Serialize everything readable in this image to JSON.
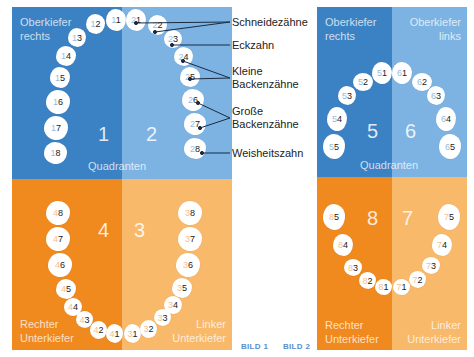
{
  "bild1": {
    "label": "BILD 1",
    "quadrants": {
      "q1": {
        "number": "1",
        "label_line1": "Oberkiefer",
        "label_line2": "rechts"
      },
      "q2": {
        "number": "2"
      },
      "q3": {
        "number": "3",
        "label_line1": "Linker",
        "label_line2": "Unterkiefer"
      },
      "q4": {
        "number": "4",
        "label_line1": "Rechter",
        "label_line2": "Unterkiefer"
      }
    },
    "center_label": "Quadranten",
    "teeth_q1": [
      "11",
      "12",
      "13",
      "14",
      "15",
      "16",
      "17",
      "18"
    ],
    "teeth_q2": [
      "21",
      "22",
      "23",
      "24",
      "25",
      "26",
      "27",
      "28"
    ],
    "teeth_q3": [
      "31",
      "32",
      "33",
      "34",
      "35",
      "36",
      "37",
      "38"
    ],
    "teeth_q4": [
      "41",
      "42",
      "43",
      "44",
      "45",
      "46",
      "47",
      "48"
    ],
    "annotations": {
      "schneidezaehne": "Schneidezähne",
      "eckzahn": "Eckzahn",
      "kleine_1": "Kleine",
      "kleine_2": "Backenzähne",
      "grosse_1": "Große",
      "grosse_2": "Backenzähne",
      "weisheitszahn": "Weisheitszahn"
    }
  },
  "bild2": {
    "label": "BILD 2",
    "quadrants": {
      "q5": {
        "number": "5",
        "label_line1": "Oberkiefer",
        "label_line2": "rechts"
      },
      "q6": {
        "number": "6",
        "label_line1": "Oberkiefer",
        "label_line2": "links"
      },
      "q7": {
        "number": "7",
        "label_line1": "Linker",
        "label_line2": "Unterkiefer"
      },
      "q8": {
        "number": "8",
        "label_line1": "Rechter",
        "label_line2": "Unterkiefer"
      }
    },
    "center_label": "Quadranten",
    "teeth_q5": [
      "51",
      "52",
      "53",
      "54",
      "55"
    ],
    "teeth_q6": [
      "61",
      "62",
      "63",
      "64",
      "65"
    ],
    "teeth_q7": [
      "71",
      "72",
      "73",
      "74",
      "75"
    ],
    "teeth_q8": [
      "81",
      "82",
      "83",
      "84",
      "85"
    ]
  },
  "colors": {
    "upper_right": "#3b82c4",
    "upper_left": "#7db3e3",
    "lower_right": "#f08a1e",
    "lower_left": "#f8b96a",
    "bild_label": "#5a8fc8"
  }
}
